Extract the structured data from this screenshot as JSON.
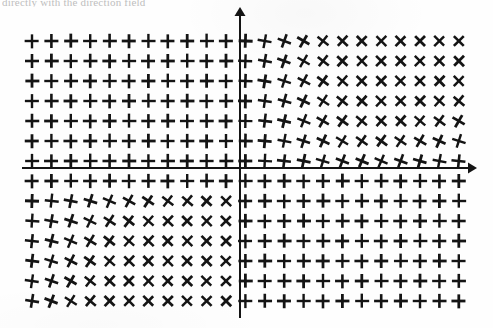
{
  "caption": {
    "text": "directly with the direction field"
  },
  "figure": {
    "background_color": "#fefefe",
    "ink_color": "#141414"
  },
  "axes": {
    "origin_x": 240,
    "origin_y": 168,
    "x_axis": {
      "name": "horizontal-axis",
      "x_start": 22,
      "x_end": 468,
      "y": 168,
      "arrow": "right",
      "label": ""
    },
    "y_axis": {
      "name": "vertical-axis",
      "y_start": 16,
      "y_end": 318,
      "x": 240,
      "arrow": "up",
      "label": ""
    },
    "stroke_width": 2
  },
  "chart_data": {
    "type": "scatter",
    "xlabel": "",
    "ylabel": "",
    "grid": false,
    "legend": null,
    "xlim": [
      -11.5,
      11.5
    ],
    "ylim": [
      -7.0,
      7.0
    ],
    "marker": "cross",
    "columns": 23,
    "rows": 14,
    "col_spacing_px": 19.4,
    "row_spacing_px": 20.0,
    "first_col_x_px": 32,
    "first_row_y_px": 41,
    "marker_arm_px": 7.0,
    "marker_stroke_px": 2.6,
    "angle_rule": "angle_deg = 45 * s(col) * s(row), smoothly ramped from the axes",
    "x_values": [
      -11,
      -10,
      -9,
      -8,
      -7,
      -6,
      -5,
      -4,
      -3,
      -2,
      -1,
      0,
      1,
      2,
      3,
      4,
      5,
      6,
      7,
      8,
      9,
      10,
      11
    ],
    "y_values": [
      7,
      6,
      5,
      4,
      3,
      2,
      1,
      0,
      -1,
      -2,
      -3,
      -4,
      -5,
      -6
    ],
    "angles_deg": [
      [
        0,
        0,
        0,
        0,
        0,
        0,
        0,
        0,
        0,
        0,
        0,
        2,
        10,
        20,
        30,
        38,
        43,
        45,
        45,
        45,
        45,
        45,
        45
      ],
      [
        0,
        0,
        0,
        0,
        0,
        0,
        0,
        0,
        0,
        0,
        0,
        2,
        10,
        20,
        30,
        38,
        43,
        45,
        45,
        45,
        45,
        45,
        45
      ],
      [
        0,
        0,
        0,
        0,
        0,
        0,
        0,
        0,
        0,
        0,
        0,
        2,
        9,
        18,
        28,
        36,
        41,
        44,
        45,
        45,
        45,
        45,
        45
      ],
      [
        0,
        0,
        0,
        0,
        0,
        0,
        0,
        0,
        0,
        0,
        0,
        1,
        8,
        16,
        25,
        33,
        39,
        42,
        44,
        45,
        44,
        42,
        40
      ],
      [
        0,
        0,
        0,
        0,
        0,
        0,
        0,
        0,
        0,
        0,
        0,
        1,
        7,
        14,
        22,
        30,
        36,
        40,
        42,
        42,
        40,
        36,
        30
      ],
      [
        0,
        0,
        0,
        0,
        0,
        0,
        0,
        0,
        0,
        0,
        0,
        1,
        5,
        11,
        18,
        25,
        31,
        35,
        36,
        34,
        30,
        24,
        18
      ],
      [
        0,
        0,
        0,
        0,
        0,
        0,
        0,
        0,
        0,
        0,
        0,
        0,
        3,
        7,
        12,
        17,
        21,
        23,
        23,
        20,
        16,
        11,
        6
      ],
      [
        0,
        0,
        0,
        0,
        0,
        0,
        0,
        0,
        0,
        0,
        0,
        0,
        0,
        0,
        0,
        0,
        0,
        0,
        0,
        0,
        0,
        0,
        0
      ],
      [
        2,
        6,
        11,
        17,
        23,
        29,
        34,
        38,
        41,
        43,
        44,
        0,
        0,
        0,
        0,
        0,
        0,
        0,
        0,
        0,
        0,
        0,
        0
      ],
      [
        4,
        10,
        18,
        26,
        33,
        38,
        42,
        44,
        45,
        45,
        45,
        0,
        0,
        0,
        0,
        0,
        0,
        0,
        0,
        0,
        0,
        0,
        0
      ],
      [
        6,
        14,
        23,
        31,
        38,
        42,
        44,
        45,
        45,
        45,
        45,
        0,
        0,
        0,
        0,
        0,
        0,
        0,
        0,
        0,
        0,
        0,
        0
      ],
      [
        7,
        17,
        27,
        35,
        41,
        44,
        45,
        45,
        45,
        45,
        45,
        0,
        0,
        0,
        0,
        0,
        0,
        0,
        0,
        0,
        0,
        0,
        0
      ],
      [
        8,
        19,
        30,
        38,
        43,
        45,
        45,
        45,
        45,
        45,
        45,
        0,
        0,
        0,
        0,
        0,
        0,
        0,
        0,
        0,
        0,
        0,
        0
      ],
      [
        9,
        21,
        32,
        40,
        44,
        45,
        45,
        45,
        45,
        45,
        45,
        0,
        0,
        0,
        0,
        0,
        0,
        0,
        0,
        0,
        0,
        0,
        0
      ]
    ]
  }
}
